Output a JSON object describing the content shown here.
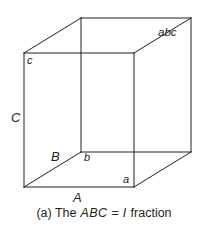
{
  "figure": {
    "kind": "cube-diagram",
    "stroke_color": "#231f20",
    "background_color": "#ffffff",
    "caption": {
      "prefix": "(a) The",
      "math_1": "ABC",
      "equals": "=",
      "math_2": "I",
      "suffix": "fraction",
      "full_text": "(a) The ABC = I fraction"
    },
    "vertex_labels": [
      {
        "id": "label-c-lower",
        "text": "c",
        "x": 27,
        "y": 55,
        "style": "lbl-lower"
      },
      {
        "id": "label-C-upper",
        "text": "C",
        "x": 11,
        "y": 111,
        "style": "lbl-upper"
      },
      {
        "id": "label-B-upper",
        "text": "B",
        "x": 51,
        "y": 150,
        "style": "lbl-upper"
      },
      {
        "id": "label-b-lower",
        "text": "b",
        "x": 84,
        "y": 152,
        "style": "lbl-lower"
      },
      {
        "id": "label-A-upper",
        "text": "A",
        "x": 73,
        "y": 191,
        "style": "lbl-upper"
      },
      {
        "id": "label-a-lower",
        "text": "a",
        "x": 123,
        "y": 174,
        "style": "lbl-lower"
      },
      {
        "id": "label-abc",
        "text": "abc",
        "x": 158,
        "y": 27,
        "style": "lbl-abc"
      }
    ],
    "geometry": {
      "front_face": [
        [
          24,
          53
        ],
        [
          134,
          53
        ],
        [
          134,
          187
        ],
        [
          24,
          187
        ]
      ],
      "back_face": [
        [
          81,
          18
        ],
        [
          191,
          18
        ],
        [
          191,
          152
        ],
        [
          81,
          152
        ]
      ],
      "connectors": [
        [
          [
            24,
            53
          ],
          [
            81,
            18
          ]
        ],
        [
          [
            134,
            53
          ],
          [
            191,
            18
          ]
        ],
        [
          [
            134,
            187
          ],
          [
            191,
            152
          ]
        ],
        [
          [
            24,
            187
          ],
          [
            81,
            152
          ]
        ]
      ]
    }
  }
}
